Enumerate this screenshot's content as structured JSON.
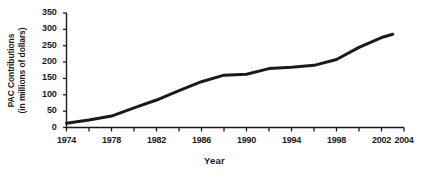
{
  "chart_data": {
    "type": "line",
    "title": "",
    "xlabel": "Year",
    "ylabel": "PAC Contributions\n(in millions of dollars)",
    "ylabel_line1": "PAC Contributions",
    "ylabel_line2": "(in millions of dollars)",
    "xlim": [
      1974,
      2004
    ],
    "ylim": [
      0,
      350
    ],
    "ytick_values": [
      0,
      50,
      100,
      150,
      200,
      250,
      300,
      350
    ],
    "ytick_labels": [
      "0",
      "50",
      "100",
      "150",
      "200",
      "250",
      "300",
      "350"
    ],
    "xtick_values": [
      1974,
      1978,
      1982,
      1986,
      1990,
      1994,
      1998,
      2002,
      2004
    ],
    "xtick_labels": [
      "1974",
      "1978",
      "1982",
      "1986",
      "1990",
      "1994",
      "1998",
      "2002",
      "2004"
    ],
    "xminor_values": [
      1976,
      1980,
      1984,
      1988,
      1992,
      1996,
      2000
    ],
    "grid": false,
    "legend": false,
    "line_color": "#1a1a1a",
    "line_width_px": 3,
    "series": [
      {
        "name": "PAC Contributions",
        "x": [
          1974,
          1976,
          1978,
          1980,
          1982,
          1984,
          1986,
          1988,
          1990,
          1992,
          1994,
          1996,
          1998,
          2000,
          2002,
          2003
        ],
        "values": [
          13,
          23,
          35,
          60,
          84,
          113,
          140,
          160,
          163,
          180,
          184,
          190,
          208,
          245,
          275,
          285
        ]
      }
    ]
  },
  "axis": {
    "x_axis_name": "year-axis",
    "y_axis_name": "pac-contributions-axis"
  }
}
